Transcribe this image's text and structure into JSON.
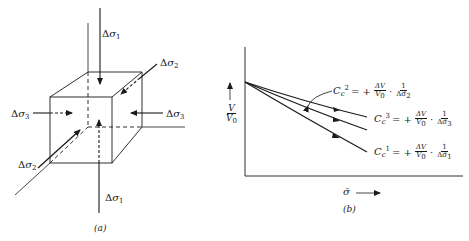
{
  "figure_a": {
    "caption": "(a)",
    "labels": {
      "sigma1_top": {
        "delta": "Δ",
        "sym": "σ",
        "sub": "1"
      },
      "sigma1_bottom": {
        "delta": "Δ",
        "sym": "σ",
        "sub": "1"
      },
      "sigma2_top": {
        "delta": "Δ",
        "sym": "σ",
        "sub": "2"
      },
      "sigma2_bottom": {
        "delta": "Δ",
        "sym": "σ",
        "sub": "2"
      },
      "sigma3_left": {
        "delta": "Δ",
        "sym": "σ",
        "sub": "3"
      },
      "sigma3_right": {
        "delta": "Δ",
        "sym": "σ",
        "sub": "3"
      }
    }
  },
  "figure_b": {
    "caption": "(b)",
    "y_axis": {
      "num": "V",
      "den": "V",
      "den_sub": "0"
    },
    "x_axis": {
      "sym": "σ̄",
      "arrow": "⟶"
    },
    "equations": [
      {
        "id": "cc2",
        "C": "C",
        "sub": "c",
        "sup": "2",
        "eq": "= +",
        "num": "ΔV",
        "den": "V",
        "den_sub": "0",
        "dot": "·",
        "frac2_num": "1",
        "frac2_den": "Δσ̄",
        "frac2_den_sub": "2"
      },
      {
        "id": "cc3",
        "C": "C",
        "sub": "c",
        "sup": "3",
        "eq": "= +",
        "num": "ΔV",
        "den": "V",
        "den_sub": "0",
        "dot": "·",
        "frac2_num": "1",
        "frac2_den": "Δσ̄",
        "frac2_den_sub": "3"
      },
      {
        "id": "cc1",
        "C": "C",
        "sub": "c",
        "sup": "1",
        "eq": "= +",
        "num": "ΔV",
        "den": "V",
        "den_sub": "0",
        "dot": "·",
        "frac2_num": "1",
        "frac2_den": "Δσ̄",
        "frac2_den_sub": "1"
      }
    ]
  },
  "colors": {
    "ink": "#1a1a1a",
    "background": "#ffffff"
  }
}
